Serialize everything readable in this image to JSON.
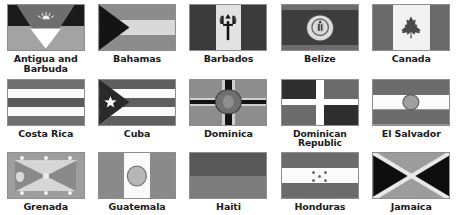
{
  "layout": {
    "columns": 5,
    "rows": 3,
    "background": "#ffffff",
    "label_color": "#1b1b1b"
  },
  "flags": [
    {
      "name": "Antigua and Barbuda",
      "label": "Antigua and Barbuda",
      "icon": "flag-antigua-and-barbuda",
      "row": 1,
      "column": 1
    },
    {
      "name": "Bahamas",
      "label": "Bahamas",
      "icon": "flag-bahamas",
      "row": 1,
      "column": 2
    },
    {
      "name": "Barbados",
      "label": "Barbados",
      "icon": "flag-barbados",
      "row": 1,
      "column": 3
    },
    {
      "name": "Belize",
      "label": "Belize",
      "icon": "flag-belize",
      "row": 1,
      "column": 4
    },
    {
      "name": "Canada",
      "label": "Canada",
      "icon": "flag-canada",
      "row": 1,
      "column": 5
    },
    {
      "name": "Costa Rica",
      "label": "Costa Rica",
      "icon": "flag-costa-rica",
      "row": 2,
      "column": 1
    },
    {
      "name": "Cuba",
      "label": "Cuba",
      "icon": "flag-cuba",
      "row": 2,
      "column": 2
    },
    {
      "name": "Dominica",
      "label": "Dominica",
      "icon": "flag-dominica",
      "row": 2,
      "column": 3
    },
    {
      "name": "Dominican Republic",
      "label": "Dominican Republic",
      "icon": "flag-dominican-republic",
      "row": 2,
      "column": 4
    },
    {
      "name": "El Salvador",
      "label": "El Salvador",
      "icon": "flag-el-salvador",
      "row": 2,
      "column": 5
    },
    {
      "name": "Grenada",
      "label": "Grenada",
      "icon": "flag-grenada",
      "row": 3,
      "column": 1
    },
    {
      "name": "Guatemala",
      "label": "Guatemala",
      "icon": "flag-guatemala",
      "row": 3,
      "column": 2
    },
    {
      "name": "Haiti",
      "label": "Haiti",
      "icon": "flag-haiti",
      "row": 3,
      "column": 3
    },
    {
      "name": "Honduras",
      "label": "Honduras",
      "icon": "flag-honduras",
      "row": 3,
      "column": 4
    },
    {
      "name": "Jamaica",
      "label": "Jamaica",
      "icon": "flag-jamaica",
      "row": 3,
      "column": 5
    }
  ]
}
